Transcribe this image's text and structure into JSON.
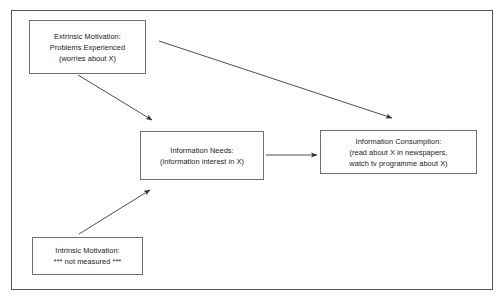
{
  "diagram": {
    "type": "flow-diagram",
    "background_color": "#ffffff",
    "frame_border_color": "#555b5e",
    "node_border_color": "#6a6f72",
    "text_color": "#17191a",
    "connector_color": "#3a3a3a",
    "nodes": [
      {
        "id": "extrinsic",
        "lines": [
          "Extrinsic Motivation:",
          "Problems Experienced",
          "(worries about X)"
        ]
      },
      {
        "id": "needs",
        "lines": [
          "Information Needs:",
          "(information interest in X)"
        ]
      },
      {
        "id": "consumption",
        "lines": [
          "Information Consumption:",
          "(read about X in newspapers,",
          "watch tv programme about X)"
        ]
      },
      {
        "id": "intrinsic",
        "lines": [
          "Intrinsic Motivation:",
          "*** not measured ***"
        ]
      }
    ],
    "connectors": [
      {
        "id": "extrinsic-to-needs",
        "from": "extrinsic",
        "to": "needs",
        "style": "solid-arrow"
      },
      {
        "id": "extrinsic-to-consumption",
        "from": "extrinsic",
        "to": "consumption",
        "style": "solid-arrow"
      },
      {
        "id": "needs-to-consumption",
        "from": "needs",
        "to": "consumption",
        "style": "solid-arrow"
      },
      {
        "id": "intrinsic-to-needs",
        "from": "intrinsic",
        "to": "needs",
        "style": "solid-arrow"
      }
    ]
  }
}
